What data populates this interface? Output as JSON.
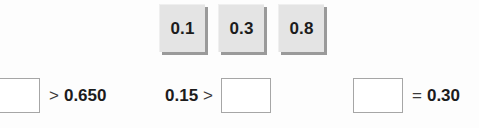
{
  "exercise": {
    "tiles": [
      {
        "label": "0.1",
        "name": "tile-0-1"
      },
      {
        "label": "0.3",
        "name": "tile-0-3"
      },
      {
        "label": "0.8",
        "name": "tile-0-8"
      }
    ],
    "statements": [
      {
        "id": "statement-1",
        "blank_value": "",
        "operator": ">",
        "right_value": "0.650",
        "blank_position": "left"
      },
      {
        "id": "statement-2",
        "left_value": "0.15",
        "operator": ">",
        "blank_value": "",
        "blank_position": "right"
      },
      {
        "id": "statement-3",
        "blank_value": "",
        "operator": "=",
        "right_value": "0.30",
        "blank_position": "left"
      }
    ]
  }
}
